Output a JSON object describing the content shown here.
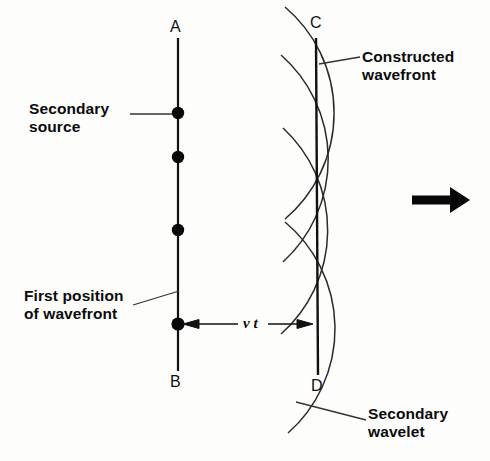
{
  "figure": {
    "type": "physics-diagram",
    "background_color": "#fdfdfc",
    "ink_color": "#111111"
  },
  "labels": {
    "secondary_source": "Secondary\nsource",
    "first_position": "First position\nof wavefront",
    "constructed_wavefront": "Constructed\nwavefront",
    "secondary_wavelet": "Secondary\nwavelet",
    "distance": "v t"
  },
  "points": {
    "a": "A",
    "b": "B",
    "c": "C",
    "d": "D"
  },
  "geometry": {
    "first_wavefront_x": 178,
    "first_wavefront_y_top": 38,
    "first_wavefront_y_bottom": 371,
    "constructed_wavefront_x": 317,
    "constructed_wavefront_y_top": 38,
    "constructed_wavefront_y_bottom": 375,
    "wavelet_radius": 139,
    "source_dots_y": [
      113,
      157,
      230,
      324
    ],
    "propagation_arrow": {
      "x1": 412,
      "x2": 468,
      "y": 200
    }
  }
}
